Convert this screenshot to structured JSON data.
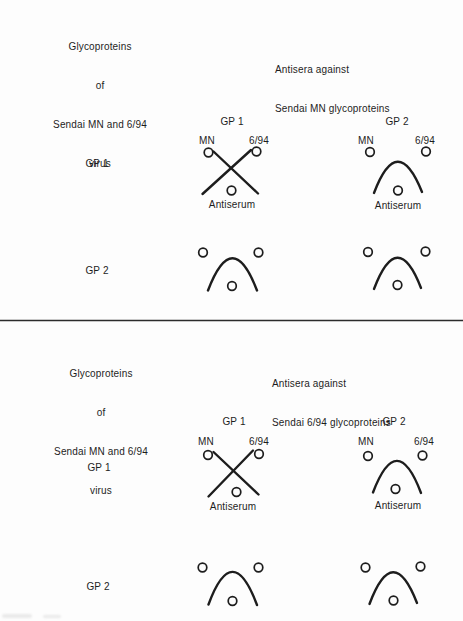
{
  "figure": {
    "background": "#fdfdfd",
    "ink_color": "#1d1d1d",
    "sections": [
      {
        "antigen_header": [
          "Glycoproteins",
          "of",
          "Sendai MN and 6/94",
          "virus"
        ],
        "antisera_header": [
          "Antisera against",
          "Sendai MN glycoproteins"
        ],
        "column_headers": [
          "GP 1",
          "GP 2"
        ],
        "row_labels": [
          "GP 1",
          "GP 2"
        ],
        "panels": [
          {
            "row": "GP 1",
            "column": "GP 1",
            "pattern": "crossed-lines",
            "well_labels": {
              "left": "MN",
              "right": "6/94",
              "bottom": "Antiserum"
            }
          },
          {
            "row": "GP 1",
            "column": "GP 2",
            "pattern": "fused-arc",
            "well_labels": {
              "left": "MN",
              "right": "6/94",
              "bottom": "Antiserum"
            }
          },
          {
            "row": "GP 2",
            "column": "GP 1",
            "pattern": "fused-arc",
            "well_labels": null
          },
          {
            "row": "GP 2",
            "column": "GP 2",
            "pattern": "fused-arc",
            "well_labels": null
          }
        ]
      },
      {
        "antigen_header": [
          "Glycoproteins",
          "of",
          "Sendai MN and 6/94",
          "virus"
        ],
        "antisera_header": [
          "Antisera against",
          "Sendai 6/94 glycoproteins"
        ],
        "column_headers": [
          "GP 1",
          "GP 2"
        ],
        "row_labels": [
          "GP 1",
          "GP 2"
        ],
        "panels": [
          {
            "row": "GP 1",
            "column": "GP 1",
            "pattern": "crossed-lines",
            "well_labels": {
              "left": "MN",
              "right": "6/94",
              "bottom": "Antiserum"
            }
          },
          {
            "row": "GP 1",
            "column": "GP 2",
            "pattern": "fused-arc",
            "well_labels": {
              "left": "MN",
              "right": "6/94",
              "bottom": "Antiserum"
            }
          },
          {
            "row": "GP 2",
            "column": "GP 1",
            "pattern": "fused-arc",
            "well_labels": null
          },
          {
            "row": "GP 2",
            "column": "GP 2",
            "pattern": "fused-arc",
            "well_labels": null
          }
        ]
      }
    ]
  }
}
